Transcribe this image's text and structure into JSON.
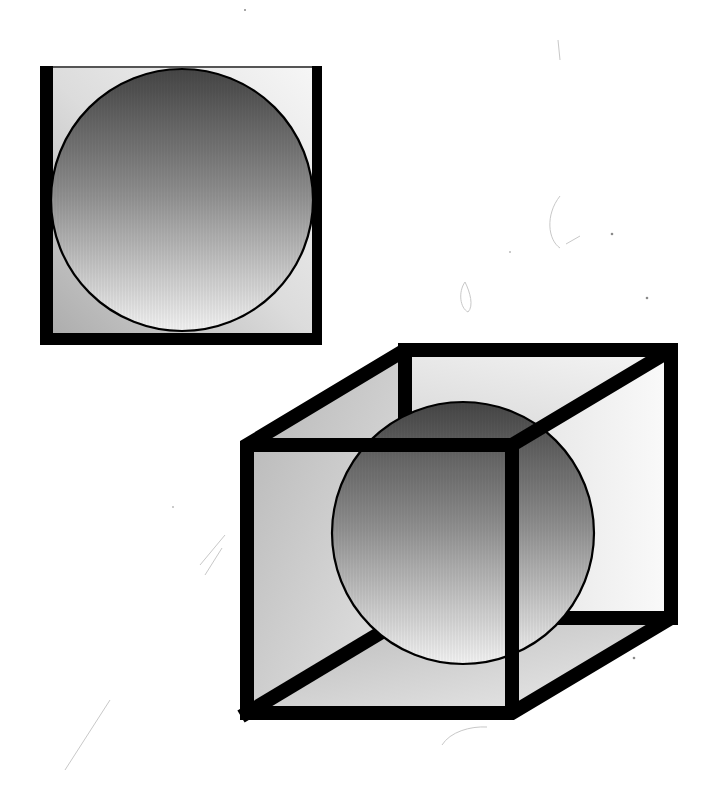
{
  "canvas": {
    "width": 707,
    "height": 785,
    "background": "#ffffff"
  },
  "colors": {
    "outline": "#000000",
    "sphere_top": "#4a4a4a",
    "sphere_mid": "#8c8c8c",
    "sphere_bottom": "#efefef",
    "face_light": "#f4f4f4",
    "face_mid": "#d9d9d9",
    "face_dark": "#a8a8a8"
  },
  "figures": [
    {
      "id": "flat-square",
      "label": "Circle inscribed in a square (2D)",
      "square": {
        "x": 40,
        "y": 66,
        "width": 282,
        "height": 278,
        "left_bar": 13,
        "right_bar": 10,
        "bottom_bar": 12,
        "top_line": 2
      },
      "circle": {
        "cx": 182,
        "cy": 200,
        "r": 131
      }
    },
    {
      "id": "wire-cube",
      "label": "Sphere inside a wireframe cube (3D)",
      "front_face": {
        "x": 247,
        "y": 445,
        "width": 265,
        "height": 268
      },
      "back_face": {
        "x": 405,
        "y": 350,
        "width": 266,
        "height": 268
      },
      "edge_width": 14,
      "sphere": {
        "cx": 463,
        "cy": 533,
        "r": 131
      }
    }
  ]
}
